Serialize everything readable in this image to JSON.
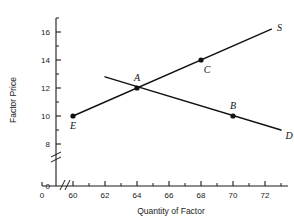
{
  "chart_data": {
    "type": "line",
    "title": "",
    "xlabel": "Quantity of Factor",
    "ylabel": "Factor Price",
    "xlim": [
      59,
      73
    ],
    "ylim": [
      7,
      17
    ],
    "x_axis_break": true,
    "y_axis_break": true,
    "grid": false,
    "legend": "none",
    "x_origin_label": "0",
    "y_origin_label": "0",
    "x_ticks": [
      60,
      62,
      64,
      66,
      68,
      70,
      72
    ],
    "x_tick_labels": [
      "60",
      "62",
      "64",
      "66",
      "68",
      "70",
      "72"
    ],
    "x_minor_ticks": [
      61,
      63,
      65,
      67,
      69,
      71
    ],
    "y_ticks": [
      8,
      10,
      12,
      14,
      16
    ],
    "y_tick_labels": [
      "8",
      "10",
      "12",
      "14",
      "16"
    ],
    "y_minor_ticks": [
      9,
      11,
      13,
      15
    ],
    "series": [
      {
        "name": "S",
        "label": "S",
        "description": "Supply curve, upward sloping",
        "x": [
          60,
          72.4
        ],
        "y": [
          10,
          16.2
        ]
      },
      {
        "name": "D",
        "label": "D",
        "description": "Demand curve, downward sloping",
        "x": [
          62.0,
          73.0
        ],
        "y": [
          12.8,
          9.0
        ]
      }
    ],
    "points": [
      {
        "label": "E",
        "x": 60,
        "y": 10,
        "label_position": "below"
      },
      {
        "label": "A",
        "x": 64,
        "y": 12,
        "label_position": "above"
      },
      {
        "label": "C",
        "x": 68,
        "y": 14,
        "label_position": "below-right"
      },
      {
        "label": "B",
        "x": 70,
        "y": 10,
        "label_position": "above"
      }
    ],
    "curve_labels": [
      {
        "label": "S",
        "x": 72.9,
        "y": 16.3
      },
      {
        "label": "D",
        "x": 73.5,
        "y": 8.55
      }
    ]
  }
}
